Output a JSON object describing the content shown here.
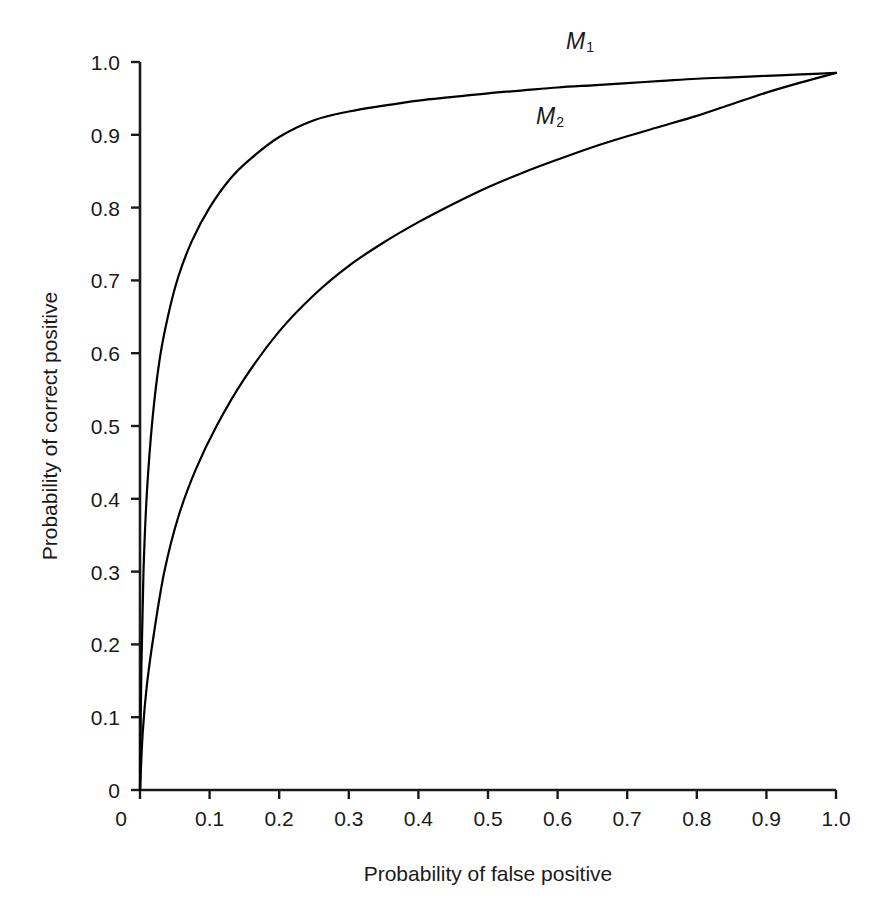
{
  "chart_data": {
    "type": "line",
    "title": "",
    "xlabel": "Probability of false positive",
    "ylabel": "Probability of correct positive",
    "xlim": [
      0,
      1
    ],
    "ylim": [
      0,
      1
    ],
    "grid": false,
    "legend_position": "inline-annotation",
    "xticks": [
      "0",
      "0.1",
      "0.2",
      "0.3",
      "0.4",
      "0.5",
      "0.6",
      "0.7",
      "0.8",
      "0.9",
      "1.0"
    ],
    "xtick_values": [
      0,
      0.1,
      0.2,
      0.3,
      0.4,
      0.5,
      0.6,
      0.7,
      0.8,
      0.9,
      1.0
    ],
    "yticks": [
      "0",
      "0.1",
      "0.2",
      "0.3",
      "0.4",
      "0.5",
      "0.6",
      "0.7",
      "0.8",
      "0.9",
      "1.0"
    ],
    "ytick_values": [
      0,
      0.1,
      0.2,
      0.3,
      0.4,
      0.5,
      0.6,
      0.7,
      0.8,
      0.9,
      1.0
    ],
    "line_color": "#000000",
    "line_width": 2.2,
    "series": [
      {
        "name": "M1",
        "label": "M",
        "subscript": "1",
        "x": [
          0.0,
          0.002,
          0.005,
          0.01,
          0.018,
          0.028,
          0.04,
          0.055,
          0.075,
          0.1,
          0.13,
          0.16,
          0.2,
          0.25,
          0.3,
          0.35,
          0.4,
          0.45,
          0.5,
          0.55,
          0.6,
          0.65,
          0.7,
          0.75,
          0.8,
          0.85,
          0.9,
          0.95,
          1.0
        ],
        "y": [
          0.0,
          0.17,
          0.3,
          0.41,
          0.51,
          0.59,
          0.65,
          0.705,
          0.755,
          0.8,
          0.84,
          0.868,
          0.897,
          0.92,
          0.932,
          0.94,
          0.947,
          0.952,
          0.957,
          0.961,
          0.965,
          0.968,
          0.971,
          0.974,
          0.977,
          0.979,
          0.981,
          0.983,
          0.985
        ]
      },
      {
        "name": "M2",
        "label": "M",
        "subscript": "2",
        "x": [
          0.0,
          0.004,
          0.01,
          0.02,
          0.035,
          0.055,
          0.08,
          0.11,
          0.15,
          0.2,
          0.25,
          0.3,
          0.35,
          0.4,
          0.45,
          0.5,
          0.55,
          0.6,
          0.65,
          0.7,
          0.75,
          0.8,
          0.85,
          0.9,
          0.95,
          1.0
        ],
        "y": [
          0.0,
          0.08,
          0.145,
          0.215,
          0.3,
          0.375,
          0.44,
          0.5,
          0.565,
          0.63,
          0.68,
          0.72,
          0.752,
          0.78,
          0.805,
          0.828,
          0.848,
          0.866,
          0.883,
          0.898,
          0.912,
          0.926,
          0.942,
          0.958,
          0.972,
          0.985
        ]
      }
    ]
  },
  "axes": {
    "x_axis_name": "x-axis",
    "y_axis_name": "y-axis"
  }
}
